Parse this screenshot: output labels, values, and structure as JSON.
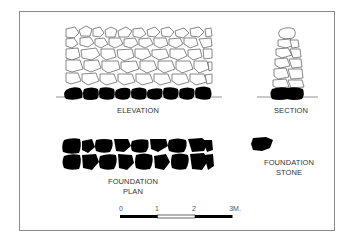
{
  "diagram": {
    "type": "stone wall construction drawing",
    "views": {
      "elevation": {
        "label": "ELEVATION"
      },
      "section": {
        "label": "SECTION"
      },
      "foundation_plan": {
        "label_line1": "FOUNDATION",
        "label_line2": "PLAN"
      },
      "foundation_stone": {
        "label_line1": "FOUNDATION",
        "label_line2": "STONE"
      }
    },
    "scale_bar": {
      "ticks": [
        "0",
        "1",
        "2",
        "3M."
      ],
      "segments": [
        "black",
        "white",
        "black"
      ]
    },
    "colors": {
      "ink": "#000000",
      "stone_outline": "#555555",
      "frame": "#8a8a8a",
      "background": "#ffffff"
    }
  }
}
